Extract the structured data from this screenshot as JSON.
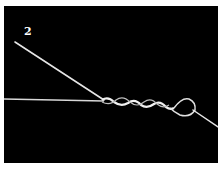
{
  "figure": {
    "step_label": "2",
    "background_color": "#000000",
    "line_color": "#e6e6e6"
  }
}
